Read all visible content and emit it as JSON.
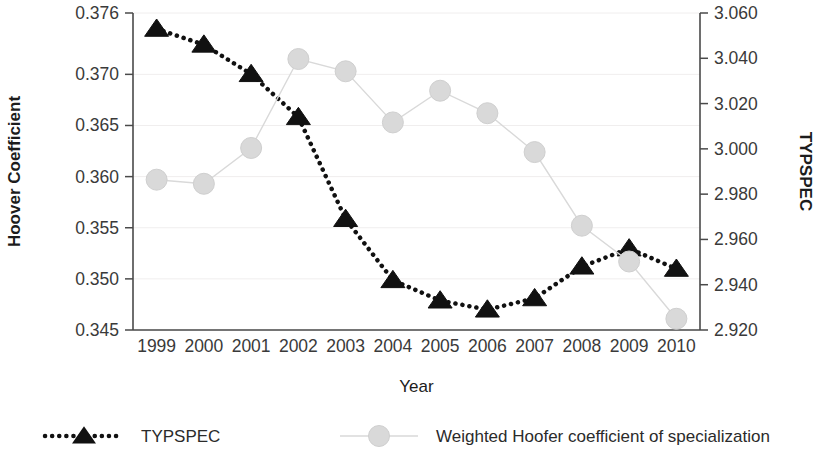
{
  "chart_data": {
    "type": "line",
    "title": "",
    "xlabel": "Year",
    "ylabel": "Hoover Coefficient",
    "y2label": "TYPSPEC",
    "grid": true,
    "legend_position": "bottom",
    "categories": [
      "1999",
      "2000",
      "2001",
      "2002",
      "2003",
      "2004",
      "2005",
      "2006",
      "2007",
      "2008",
      "2009",
      "2010"
    ],
    "ylim": [
      0.345,
      0.376
    ],
    "yticks": [
      "0.345",
      "0.350",
      "0.355",
      "0.360",
      "0.365",
      "0.370",
      "0.376"
    ],
    "ytick_values": [
      0.345,
      0.35,
      0.355,
      0.36,
      0.365,
      0.37,
      0.376
    ],
    "y2lim": [
      2.92,
      3.06
    ],
    "y2ticks": [
      "2.920",
      "2.940",
      "2.960",
      "2.980",
      "3.000",
      "3.020",
      "3.040",
      "3.060"
    ],
    "y2tick_values": [
      2.92,
      2.94,
      2.96,
      2.98,
      3.0,
      3.02,
      3.04,
      3.06
    ],
    "series": [
      {
        "name": "TYPSPEC",
        "axis": "right",
        "marker": "triangle",
        "color": "#111111",
        "line_style": "dotted",
        "values": [
          3.053,
          3.046,
          3.033,
          3.014,
          2.969,
          2.942,
          2.933,
          2.929,
          2.934,
          2.948,
          2.956,
          2.947
        ]
      },
      {
        "name": "Weighted Hoofer coefficient of specialization",
        "axis": "left",
        "marker": "circle",
        "color": "#d9d9d9",
        "line_style": "solid",
        "values": [
          0.3597,
          0.3593,
          0.3628,
          0.3715,
          0.3703,
          0.3653,
          0.3684,
          0.3662,
          0.3624,
          0.3552,
          0.3517,
          0.3461
        ]
      }
    ]
  },
  "legend": {
    "items": [
      {
        "label": "TYPSPEC",
        "marker": "triangle",
        "color": "#111111",
        "line_style": "dotted"
      },
      {
        "label": "Weighted Hoofer coefficient of specialization",
        "marker": "circle",
        "color": "#d9d9d9",
        "line_style": "solid"
      }
    ]
  }
}
